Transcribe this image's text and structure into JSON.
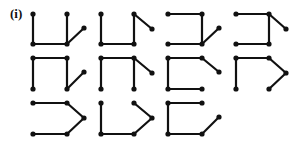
{
  "label": "(i)",
  "style": {
    "stroke": "#111111",
    "dot": "#111111",
    "stroke_width": 2.2,
    "dot_radius": 2.6
  },
  "figures": [
    {
      "id": "r1c1",
      "points": [
        [
          33,
          14
        ],
        [
          33,
          44
        ],
        [
          67,
          44
        ],
        [
          67,
          14
        ],
        [
          84,
          28
        ]
      ],
      "edges": [
        [
          0,
          1
        ],
        [
          1,
          2
        ],
        [
          2,
          3
        ],
        [
          2,
          4
        ]
      ]
    },
    {
      "id": "r1c2",
      "points": [
        [
          101,
          14
        ],
        [
          101,
          44
        ],
        [
          134,
          44
        ],
        [
          134,
          14
        ],
        [
          152,
          29
        ]
      ],
      "edges": [
        [
          0,
          1
        ],
        [
          1,
          2
        ],
        [
          2,
          3
        ],
        [
          3,
          4
        ]
      ]
    },
    {
      "id": "r1c3",
      "points": [
        [
          168,
          14
        ],
        [
          202,
          14
        ],
        [
          202,
          44
        ],
        [
          168,
          44
        ],
        [
          219,
          28
        ]
      ],
      "edges": [
        [
          0,
          1
        ],
        [
          1,
          2
        ],
        [
          2,
          3
        ],
        [
          2,
          4
        ]
      ]
    },
    {
      "id": "r1c4",
      "points": [
        [
          236,
          14
        ],
        [
          269,
          14
        ],
        [
          269,
          44
        ],
        [
          236,
          44
        ],
        [
          286,
          29
        ]
      ],
      "edges": [
        [
          0,
          1
        ],
        [
          1,
          2
        ],
        [
          2,
          3
        ],
        [
          1,
          4
        ]
      ]
    },
    {
      "id": "r2c1",
      "points": [
        [
          33,
          58
        ],
        [
          67,
          58
        ],
        [
          33,
          89
        ],
        [
          67,
          89
        ],
        [
          84,
          72
        ]
      ],
      "edges": [
        [
          0,
          1
        ],
        [
          0,
          2
        ],
        [
          1,
          3
        ],
        [
          3,
          4
        ]
      ]
    },
    {
      "id": "r2c2",
      "points": [
        [
          101,
          58
        ],
        [
          134,
          58
        ],
        [
          101,
          89
        ],
        [
          134,
          89
        ],
        [
          152,
          73
        ]
      ],
      "edges": [
        [
          0,
          1
        ],
        [
          0,
          2
        ],
        [
          1,
          3
        ],
        [
          1,
          4
        ]
      ]
    },
    {
      "id": "r2c3",
      "points": [
        [
          168,
          58
        ],
        [
          202,
          58
        ],
        [
          168,
          89
        ],
        [
          202,
          89
        ],
        [
          219,
          72
        ]
      ],
      "edges": [
        [
          0,
          1
        ],
        [
          0,
          2
        ],
        [
          2,
          3
        ],
        [
          1,
          4
        ]
      ]
    },
    {
      "id": "r2c4",
      "points": [
        [
          236,
          58
        ],
        [
          269,
          58
        ],
        [
          236,
          89
        ],
        [
          286,
          73
        ],
        [
          269,
          89
        ]
      ],
      "edges": [
        [
          0,
          1
        ],
        [
          0,
          2
        ],
        [
          1,
          3
        ],
        [
          3,
          4
        ]
      ]
    },
    {
      "id": "r3c1",
      "points": [
        [
          33,
          103
        ],
        [
          67,
          103
        ],
        [
          84,
          118
        ],
        [
          67,
          134
        ],
        [
          33,
          134
        ]
      ],
      "edges": [
        [
          0,
          1
        ],
        [
          1,
          2
        ],
        [
          2,
          3
        ],
        [
          3,
          4
        ]
      ]
    },
    {
      "id": "r3c2",
      "points": [
        [
          101,
          103
        ],
        [
          101,
          134
        ],
        [
          134,
          134
        ],
        [
          152,
          118
        ],
        [
          134,
          103
        ]
      ],
      "edges": [
        [
          0,
          1
        ],
        [
          1,
          2
        ],
        [
          2,
          3
        ],
        [
          3,
          4
        ]
      ]
    },
    {
      "id": "r3c3",
      "points": [
        [
          168,
          103
        ],
        [
          202,
          103
        ],
        [
          168,
          134
        ],
        [
          202,
          134
        ],
        [
          219,
          117
        ]
      ],
      "edges": [
        [
          0,
          1
        ],
        [
          0,
          2
        ],
        [
          2,
          3
        ],
        [
          3,
          4
        ]
      ]
    }
  ]
}
